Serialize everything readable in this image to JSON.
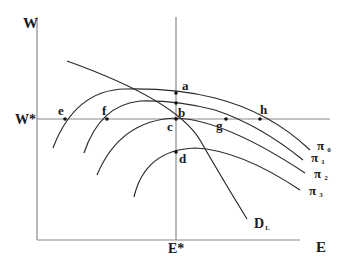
{
  "diagram": {
    "type": "labor-market isoprofit diagram",
    "axes": {
      "y_label": "W",
      "x_label": "E",
      "y_marker": "W*",
      "x_marker": "E*"
    },
    "curves": {
      "demand": "D",
      "demand_subscript": "L",
      "isoprofit": [
        {
          "symbol": "π",
          "subscript": "0"
        },
        {
          "symbol": "π",
          "subscript": "1"
        },
        {
          "symbol": "π",
          "subscript": "2"
        },
        {
          "symbol": "π",
          "subscript": "3"
        }
      ]
    },
    "points": {
      "a": "a",
      "b": "b",
      "c": "c",
      "d": "d",
      "e": "e",
      "f": "f",
      "g": "g",
      "h": "h"
    }
  },
  "colors": {
    "axis": "#8a8a8a",
    "curve": "#2a2a2a",
    "text": "#1a1a1a"
  }
}
